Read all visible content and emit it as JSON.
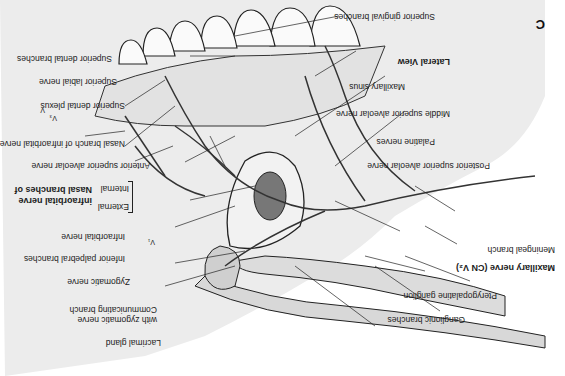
{
  "figure": {
    "panel_letter": "C",
    "view_title": "Lateral View",
    "orientation": "rotated 180 degrees"
  },
  "labels": {
    "superior_gingival_branches": "Superior gingival branches",
    "maxillary_sinus": "Maxillary sinus",
    "middle_superior_alveolar_nerve": "Middle superior alveolar nerve",
    "palatine_nerves": "Palatine nerves",
    "posterior_superior_alveolar_nerve": "Posterior superior alveolar nerve",
    "meningeal_branch": "Meningeal branch",
    "maxillary_nerve": "Maxillary nerve (CN V₂)",
    "pterygopalatine_ganglion": "Pterygopalatine ganglion",
    "ganglionic_branches": "Ganglionic branches",
    "superior_dental_branches": "Superior dental branches",
    "superior_labial_nerve": "Superior labial nerve",
    "superior_dental_plexus": "Superior dental plexus",
    "nasal_branch_infraorbital": "Nasal branch of infraorbital nerve",
    "anterior_superior_alveolar_nerve": "Anterior superior alveolar nerve",
    "internal": "Internal",
    "external": "External",
    "nasal_branches_title_1": "Nasal branches of",
    "nasal_branches_title_2": "infraorbital nerve",
    "infraorbital_nerve": "Infraorbital nerve",
    "inferior_palpebral_branches": "Inferior palpebral branches",
    "zygomatic_nerve": "Zygomatic nerve",
    "communicating_branch_1": "Communicating branch",
    "communicating_branch_2": "with zygomatic nerve",
    "lacrimal_gland": "Lacrimal gland",
    "v1": "V₁",
    "v3": "V₃"
  }
}
